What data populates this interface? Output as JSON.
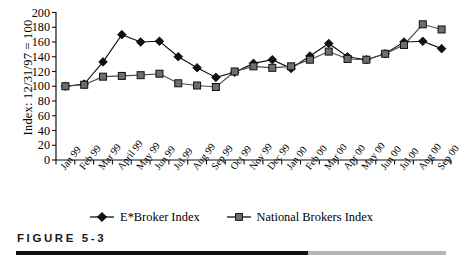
{
  "figure": {
    "caption": "FIGURE 5-3"
  },
  "chart_data": {
    "type": "line",
    "title": "",
    "xlabel": "",
    "ylabel": "Index: 12/31/97 = 100",
    "ylim": [
      0,
      200
    ],
    "ytick_step": 20,
    "yticks": [
      "200",
      "180",
      "160",
      "140",
      "120",
      "100",
      "80",
      "60",
      "40",
      "20",
      "0"
    ],
    "grid": false,
    "legend_position": "bottom-center",
    "categories": [
      "Jan 99",
      "Feb 99",
      "Mar 99",
      "April 99",
      "May 99",
      "Jun 99",
      "Jul 99",
      "Aug 99",
      "Sep 99",
      "Oct 99",
      "Nov 99",
      "Dec 99",
      "Jan 00",
      "Feb 00",
      "Mar 00",
      "Apr 00",
      "May 00",
      "Jun 00",
      "Jul 00",
      "Aug 00",
      "Sep 00"
    ],
    "series": [
      {
        "name": "E*Broker Index",
        "marker": "diamond",
        "color": "#111111",
        "values": [
          100,
          103,
          133,
          170,
          160,
          161,
          140,
          125,
          112,
          119,
          131,
          136,
          124,
          141,
          158,
          140,
          136,
          144,
          160,
          161,
          151
        ]
      },
      {
        "name": "National Brokers Index",
        "marker": "square",
        "color": "#6e6e6e",
        "values": [
          100,
          102,
          113,
          114,
          115,
          117,
          104,
          101,
          99,
          120,
          127,
          125,
          127,
          136,
          147,
          137,
          136,
          144,
          156,
          184,
          177
        ]
      }
    ]
  }
}
